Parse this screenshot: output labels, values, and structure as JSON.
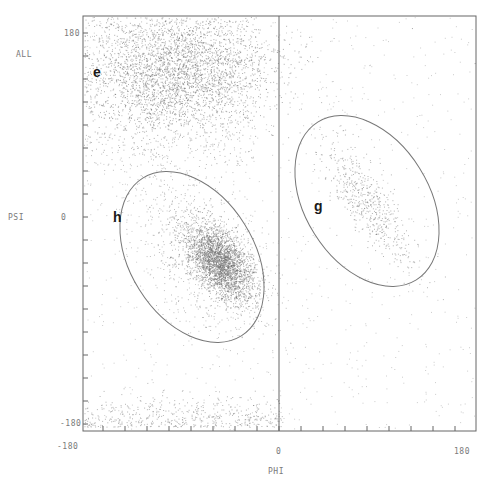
{
  "chart_data": {
    "type": "scatter",
    "title": "ALL",
    "xlabel": "PHI",
    "ylabel": "PSI",
    "xlim": [
      -180,
      180
    ],
    "ylim": [
      -180,
      180
    ],
    "x_tick_labels": [
      "-180",
      "0",
      "180"
    ],
    "y_tick_labels": [
      "180",
      "0",
      "-180"
    ],
    "grid": false,
    "vertical_reference_line_at_phi": 0,
    "regions": [
      {
        "label": "e",
        "description": "dense beta-sheet cluster",
        "phi_range": [
          -170,
          -50
        ],
        "psi_range": [
          100,
          180
        ]
      },
      {
        "label": "h",
        "description": "ellipse around dense alpha-helix cluster",
        "center": [
          -90,
          -40
        ],
        "dense_core": [
          -65,
          -45
        ]
      },
      {
        "label": "g",
        "description": "ellipse around left-handed helix cluster",
        "center": [
          80,
          15
        ]
      }
    ],
    "ellipses": [
      {
        "label": "h",
        "cx_deg": -90,
        "cy_deg": -40,
        "rx_deg": 95,
        "ry_deg": 55,
        "rotation_deg": 55
      },
      {
        "label": "g",
        "cx_deg": 80,
        "cy_deg": 15,
        "rx_deg": 95,
        "ry_deg": 55,
        "rotation_deg": 55
      }
    ]
  },
  "labels": {
    "title": "ALL",
    "y_axis": "PSI",
    "x_axis": "PHI",
    "y_top": "180",
    "y_mid": "0",
    "y_bottom": "-180",
    "x_left": "-180",
    "x_mid": "0",
    "x_right": "180",
    "region_e": "e",
    "region_h": "h",
    "region_g": "g"
  },
  "colors": {
    "axis": "#555555",
    "points": "#6e6e6e",
    "ellipse": "#6a6a6a",
    "text": "#7a7a7a"
  }
}
